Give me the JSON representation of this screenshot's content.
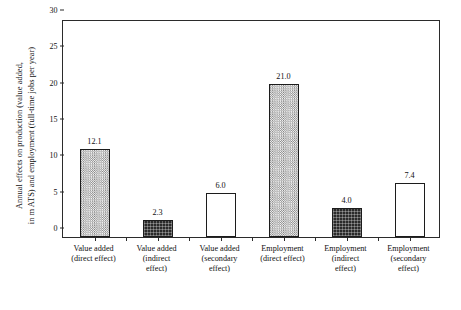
{
  "chart_data": {
    "type": "bar",
    "title": "",
    "xlabel": "",
    "ylabel_lines": [
      "Annual effects on production (value added,",
      "in m ATS) and employment (full-time jobs per year)"
    ],
    "ylabel": "Annual effects on production (value added, in m ATS) and employment (full-time jobs per year)",
    "ylim": [
      0,
      30
    ],
    "yticks": [
      0,
      5,
      10,
      15,
      20,
      25,
      30
    ],
    "ytick_labels": [
      "0",
      "5",
      "10",
      "15",
      "20",
      "25",
      "30"
    ],
    "grid": false,
    "legend": false,
    "categories": [
      "Value added (direct effect)",
      "Value added (indirect effect)",
      "Value added (secondary effect)",
      "Employment (direct effect)",
      "Employment (indirect effect)",
      "Employment (secondary effect)"
    ],
    "category_label_lines": [
      [
        "Value added",
        "(direct effect)"
      ],
      [
        "Value added",
        "(indirect",
        "effect)"
      ],
      [
        "Value added",
        "(secondary",
        "effect)"
      ],
      [
        "Employment",
        "(direct effect)"
      ],
      [
        "Employment",
        "(indirect",
        "effect)"
      ],
      [
        "Employment",
        "(secondary",
        "effect)"
      ]
    ],
    "values": [
      12.1,
      2.3,
      6.0,
      21.0,
      4.0,
      7.4
    ],
    "value_labels": [
      "12.1",
      "2.3",
      "6.0",
      "21.0",
      "4.0",
      "7.4"
    ],
    "bar_fills": [
      "hatch",
      "solid",
      "empty",
      "hatch",
      "solid",
      "empty"
    ],
    "colors": {
      "hatch": "#b9b9b9",
      "solid": "#2a2a2a",
      "empty": "#ffffff",
      "bar_edge": "#1c1c1c",
      "axis": "#2b2b2b",
      "text": "#111111",
      "background": "#ffffff"
    }
  }
}
